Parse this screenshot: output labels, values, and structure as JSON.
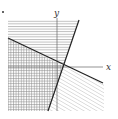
{
  "diagram": {
    "type": "linear-inequality-regions",
    "marker": "•",
    "axes": {
      "x_label": "x",
      "y_label": "y"
    },
    "lines": [
      {
        "name": "steep-line",
        "from": [
          79,
          20
        ],
        "to": [
          48,
          111
        ]
      },
      {
        "name": "shallow-line",
        "from": [
          8,
          38
        ],
        "to": [
          103,
          83
        ]
      }
    ],
    "regions": [
      {
        "name": "top-left",
        "fill": "horizontal-hatch"
      },
      {
        "name": "bottom-left",
        "fill": "cross-hatch"
      },
      {
        "name": "bottom-right",
        "fill": "diagonal-hatch"
      },
      {
        "name": "top-right",
        "fill": "none"
      }
    ],
    "colors": {
      "line": "#222222",
      "axis": "#666666",
      "hatch": "#9a9a9a",
      "background": "#ffffff"
    }
  }
}
